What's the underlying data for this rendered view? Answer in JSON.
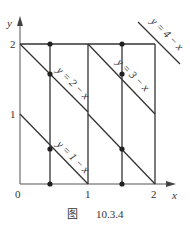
{
  "figure": {
    "caption_prefix": "图",
    "caption_number": "10.3.4",
    "axes": {
      "x_label": "x",
      "y_label": "y",
      "origin_label": "0",
      "x_ticks": [
        "1",
        "2"
      ],
      "y_ticks": [
        "1",
        "2"
      ]
    },
    "lines": [
      {
        "label": "y = 1 − x",
        "equation": "y=1-x"
      },
      {
        "label": "y = 2 − x",
        "equation": "y=2-x"
      },
      {
        "label": "y = 3 − x",
        "equation": "y=3-x"
      },
      {
        "label": "y = 4 − x",
        "equation": "y=4-x"
      }
    ],
    "vertical_lines_x": [
      0.5,
      1,
      1.5,
      2
    ],
    "horizontal_line_y": 2,
    "points": [
      {
        "x": 0.5,
        "y": 0
      },
      {
        "x": 0.5,
        "y": 0.5
      },
      {
        "x": 0.5,
        "y": 1.5
      },
      {
        "x": 0.5,
        "y": 2
      },
      {
        "x": 1.5,
        "y": 0
      },
      {
        "x": 1.5,
        "y": 1.5
      },
      {
        "x": 1.5,
        "y": 2
      }
    ],
    "line_color": "#333333",
    "axis_color": "#555555"
  }
}
